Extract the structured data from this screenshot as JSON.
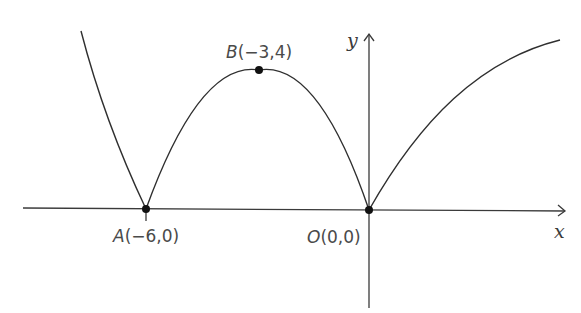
{
  "diagram": {
    "type": "function-graph",
    "axes": {
      "x_label": "x",
      "y_label": "y"
    },
    "points": {
      "A": {
        "name": "A",
        "coords": "(−6,0)"
      },
      "B": {
        "name": "B",
        "coords": "(−3,4)"
      },
      "O": {
        "name": "O",
        "coords": "(0,0)"
      }
    },
    "colors": {
      "curve": "#2f2f2f",
      "axis": "#3a3a3a",
      "label": "#4a4a4a"
    }
  }
}
